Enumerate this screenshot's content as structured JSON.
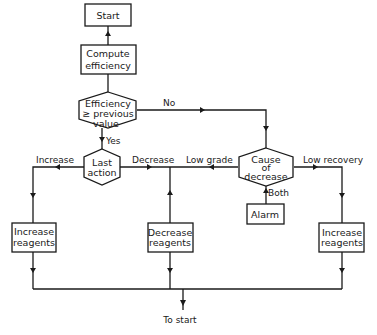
{
  "diagram": {
    "nodes": {
      "start": {
        "label": "Start"
      },
      "compute": {
        "line1": "Compute",
        "line2": "efficiency"
      },
      "efficiency_check": {
        "line1": "Efficiency",
        "line2": "≥ previous",
        "line3": "value"
      },
      "last_action": {
        "line1": "Last",
        "line2": "action"
      },
      "cause": {
        "line1": "Cause",
        "line2": "of",
        "line3": "decrease"
      },
      "alarm": {
        "label": "Alarm"
      },
      "increase_left": {
        "line1": "Increase",
        "line2": "reagents"
      },
      "decrease": {
        "line1": "Decrease",
        "line2": "reagents"
      },
      "increase_right": {
        "line1": "Increase",
        "line2": "reagents"
      }
    },
    "edges": {
      "no": "No",
      "yes": "Yes",
      "increase": "Increase",
      "decrease": "Decrease",
      "low_grade": "Low grade",
      "low_recovery": "Low recovery",
      "both": "Both",
      "to_start": "To start"
    }
  }
}
